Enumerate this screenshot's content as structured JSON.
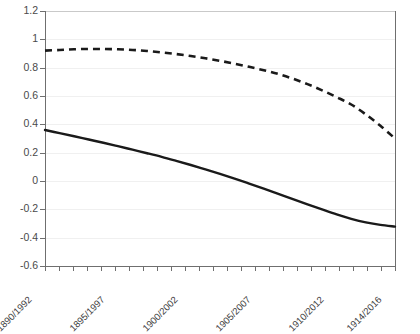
{
  "chart_data": {
    "type": "line",
    "title": "",
    "subtitle": "",
    "xlabel": "",
    "ylabel": "",
    "ylim": [
      -0.6,
      1.2
    ],
    "ytick_values": [
      1.2,
      1,
      0.8,
      0.6,
      0.4,
      0.2,
      0,
      -0.2,
      -0.4,
      -0.6
    ],
    "ytick_labels": [
      "1.2",
      "1",
      "0.8",
      "0.6",
      "0.4",
      "0.2",
      "0",
      "-0.2",
      "-0.4",
      "-0.6"
    ],
    "grid": true,
    "grid_axis": "y",
    "legend": "none",
    "x_tick_count": 26,
    "x_label_every": 5,
    "categories": [
      "1890/1992",
      "1891/1993",
      "1892/1994",
      "1893/1995",
      "1894/1996",
      "1895/1997",
      "1896/1998",
      "1897/1999",
      "1898/2000",
      "1899/2001",
      "1900/2002",
      "1901/2003",
      "1902/2004",
      "1903/2005",
      "1904/2006",
      "1905/2007",
      "1906/2008",
      "1907/2009",
      "1908/2010",
      "1909/2011",
      "1910/2012",
      "1911/2013",
      "1912/2014",
      "1913/2015",
      "1914/2016"
    ],
    "xtick_labels_shown": [
      "1890/1992",
      "1895/1997",
      "1900/2002",
      "1905/2007",
      "1910/2012",
      "1914/2016"
    ],
    "series": [
      {
        "name": "dashed-series",
        "style": "dashed",
        "color": "#1a1a1a",
        "values": [
          0.92,
          0.925,
          0.93,
          0.932,
          0.932,
          0.93,
          0.925,
          0.918,
          0.908,
          0.896,
          0.882,
          0.866,
          0.848,
          0.828,
          0.806,
          0.782,
          0.755,
          0.722,
          0.684,
          0.64,
          0.592,
          0.54,
          0.47,
          0.39,
          0.3
        ]
      },
      {
        "name": "solid-series",
        "style": "solid",
        "color": "#1a1a1a",
        "values": [
          0.36,
          0.338,
          0.316,
          0.293,
          0.27,
          0.246,
          0.221,
          0.196,
          0.17,
          0.142,
          0.113,
          0.082,
          0.05,
          0.017,
          -0.018,
          -0.054,
          -0.091,
          -0.128,
          -0.165,
          -0.201,
          -0.236,
          -0.267,
          -0.292,
          -0.31,
          -0.322
        ]
      }
    ]
  },
  "ghost_header": {
    "text": ""
  }
}
